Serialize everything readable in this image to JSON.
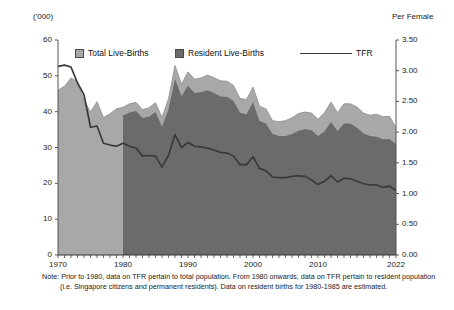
{
  "unit_labels": {
    "left": "('000)",
    "right": "Per Female"
  },
  "legend": [
    {
      "key": "total",
      "label": "Total Live-Births",
      "marker": "square-swatch-icon",
      "color": "#a8a8a8"
    },
    {
      "key": "resident",
      "label": "Resident Live-Births",
      "marker": "square-swatch-icon",
      "color": "#6b6b6b"
    },
    {
      "key": "tfr",
      "label": "TFR",
      "marker": "line-swatch-icon",
      "color": "#3a3a3a"
    }
  ],
  "note": {
    "prefix": "Note:",
    "text": "Prior to 1980, data on TFR pertain to total population. From 1980 onwards, data on TFR pertain to resident population (i.e. Singapore citizens and permanent residents). Data on resident births for 1980-1985 are estimated."
  },
  "chart_data": {
    "type": "area",
    "title": "",
    "subtitle": "",
    "xlabel": "",
    "ylabel": "('000)",
    "y2label": "Per Female",
    "grid": false,
    "legend_position": "top",
    "xlim": [
      1970,
      2022
    ],
    "ylim": [
      0,
      60
    ],
    "y2lim": [
      0,
      3.5
    ],
    "yticks": [
      0,
      10,
      20,
      30,
      40,
      50,
      60
    ],
    "ytick_labels": [
      "0",
      "10",
      "20",
      "30",
      "40",
      "50",
      "60"
    ],
    "y2ticks": [
      0.0,
      0.5,
      1.0,
      1.5,
      2.0,
      2.5,
      3.0,
      3.5
    ],
    "y2tick_labels": [
      "0.00",
      "0.50",
      "1.00",
      "1.50",
      "2.00",
      "2.50",
      "3.00",
      "3.50"
    ],
    "xticks": [
      1970,
      1980,
      1990,
      2000,
      2010,
      2022
    ],
    "xtick_labels": [
      "1970",
      "1980",
      "1990",
      "2000",
      "2010",
      "2022"
    ],
    "x": [
      1970,
      1971,
      1972,
      1973,
      1974,
      1975,
      1976,
      1977,
      1978,
      1979,
      1980,
      1981,
      1982,
      1983,
      1984,
      1985,
      1986,
      1987,
      1988,
      1989,
      1990,
      1991,
      1992,
      1993,
      1994,
      1995,
      1996,
      1997,
      1998,
      1999,
      2000,
      2001,
      2002,
      2003,
      2004,
      2005,
      2006,
      2007,
      2008,
      2009,
      2010,
      2011,
      2012,
      2013,
      2014,
      2015,
      2016,
      2017,
      2018,
      2019,
      2020,
      2021,
      2022
    ],
    "series": [
      {
        "name": "Total Live-Births",
        "type": "area",
        "axis": "left",
        "color": "#a8a8a8",
        "values": [
          46.0,
          47.1,
          49.4,
          48.3,
          43.3,
          39.9,
          42.8,
          38.4,
          39.4,
          40.8,
          41.2,
          42.2,
          42.6,
          40.6,
          41.1,
          42.5,
          38.4,
          43.6,
          52.9,
          47.7,
          51.1,
          49.1,
          49.4,
          50.2,
          49.5,
          48.6,
          48.5,
          47.3,
          43.7,
          43.4,
          46.9,
          41.5,
          40.8,
          37.5,
          37.2,
          37.5,
          38.3,
          39.5,
          39.9,
          39.6,
          37.9,
          39.7,
          42.7,
          39.7,
          42.2,
          42.2,
          41.3,
          39.6,
          39.0,
          39.3,
          38.6,
          38.7,
          35.6
        ]
      },
      {
        "name": "Resident Live-Births",
        "type": "area",
        "axis": "left",
        "color": "#6b6b6b",
        "values": [
          null,
          null,
          null,
          null,
          null,
          null,
          null,
          null,
          null,
          null,
          38.9,
          39.8,
          40.2,
          38.2,
          38.6,
          39.9,
          35.8,
          40.6,
          49.1,
          44.3,
          47.2,
          45.2,
          45.4,
          46.0,
          45.2,
          44.2,
          44.1,
          43.0,
          39.7,
          39.3,
          42.6,
          37.4,
          36.7,
          33.8,
          33.2,
          33.2,
          33.8,
          34.7,
          35.1,
          34.8,
          33.2,
          34.5,
          37.1,
          34.6,
          36.7,
          36.6,
          35.5,
          33.9,
          33.2,
          33.0,
          32.3,
          32.4,
          31.0
        ]
      },
      {
        "name": "TFR",
        "type": "line",
        "axis": "right",
        "color": "#3a3a3a",
        "values": [
          3.07,
          3.09,
          3.06,
          2.8,
          2.61,
          2.08,
          2.1,
          1.82,
          1.79,
          1.77,
          1.82,
          1.77,
          1.74,
          1.61,
          1.62,
          1.61,
          1.43,
          1.62,
          1.96,
          1.75,
          1.83,
          1.77,
          1.76,
          1.74,
          1.71,
          1.67,
          1.66,
          1.61,
          1.47,
          1.47,
          1.6,
          1.41,
          1.37,
          1.27,
          1.26,
          1.26,
          1.28,
          1.29,
          1.28,
          1.22,
          1.15,
          1.2,
          1.29,
          1.19,
          1.25,
          1.24,
          1.2,
          1.16,
          1.14,
          1.14,
          1.1,
          1.12,
          1.05
        ]
      }
    ],
    "annotations": [
      "Prior to 1980, data on TFR pertain to total population.",
      "From 1980 onwards, data on TFR pertain to resident population (i.e. Singapore citizens and permanent residents).",
      "Data on resident births for 1980-1985 are estimated."
    ]
  }
}
